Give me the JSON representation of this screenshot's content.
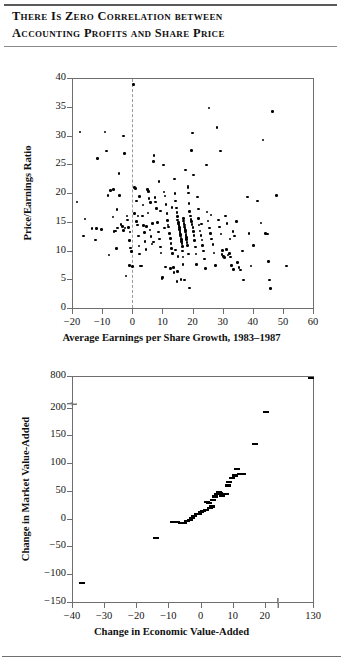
{
  "figure": {
    "title_line1": "There Is Zero Correlation between",
    "title_line2": "Accounting Profits and Share Price",
    "marker_color": "#000000",
    "axis_color": "#6e6e6e",
    "rule_color": "#5a5a5a"
  },
  "chart_data": [
    {
      "id": "scatter-pe-vs-eps-growth",
      "type": "scatter",
      "title": "",
      "xlabel": "Average Earnings per Share Growth, 1983–1987",
      "ylabel": "Price/Earnings Ratio",
      "xlim": [
        -20,
        60
      ],
      "ylim": [
        0,
        40
      ],
      "xticks": [
        -20,
        -10,
        0,
        10,
        20,
        30,
        40,
        50,
        60
      ],
      "xticklabels": [
        "−20",
        "−10",
        "0",
        "10",
        "20",
        "30",
        "40",
        "50",
        "60"
      ],
      "yticks": [
        0,
        5,
        10,
        15,
        20,
        25,
        30,
        35,
        40
      ],
      "yticklabels": [
        "0",
        "5",
        "10",
        "15",
        "20",
        "25",
        "30",
        "35",
        "40"
      ],
      "grid": false,
      "legend": "none",
      "annotations": [
        {
          "kind": "vline",
          "x": 0,
          "style": "dashed",
          "color": "#9a9a9a"
        }
      ],
      "points": [
        [
          -17.4,
          30.6
        ],
        [
          -18.3,
          18.4
        ],
        [
          -15.7,
          15.5
        ],
        [
          -16.2,
          12.5
        ],
        [
          -13.4,
          13.8
        ],
        [
          -11.9,
          13.8
        ],
        [
          -11.5,
          26.0
        ],
        [
          -12.2,
          11.8
        ],
        [
          -9.0,
          30.6
        ],
        [
          -8.5,
          27.3
        ],
        [
          -7.3,
          20.4
        ],
        [
          -6.3,
          20.6
        ],
        [
          -7.7,
          9.2
        ],
        [
          -6.4,
          15.8
        ],
        [
          -6.0,
          13.3
        ],
        [
          -5.6,
          13.4
        ],
        [
          -5.2,
          10.3
        ],
        [
          -4.9,
          13.9
        ],
        [
          -4.4,
          23.4
        ],
        [
          -4.2,
          19.6
        ],
        [
          -3.0,
          29.9
        ],
        [
          -2.6,
          26.9
        ],
        [
          -3.3,
          14.2
        ],
        [
          -2.9,
          13.5
        ],
        [
          -2.4,
          13.9
        ],
        [
          -2.1,
          5.6
        ],
        [
          -1.6,
          15.3
        ],
        [
          -1.3,
          14.0
        ],
        [
          -1.0,
          11.7
        ],
        [
          -0.7,
          13.2
        ],
        [
          -0.5,
          10.4
        ],
        [
          -0.2,
          9.8
        ],
        [
          0.4,
          38.9
        ],
        [
          0.7,
          21.0
        ],
        [
          1.1,
          20.8
        ],
        [
          1.4,
          15.0
        ],
        [
          1.8,
          14.4
        ],
        [
          2.0,
          12.5
        ],
        [
          2.3,
          10.8
        ],
        [
          2.5,
          9.4
        ],
        [
          2.8,
          7.3
        ],
        [
          3.1,
          7.3
        ],
        [
          3.4,
          16.0
        ],
        [
          3.7,
          14.3
        ],
        [
          4.0,
          13.1
        ],
        [
          4.3,
          11.6
        ],
        [
          4.6,
          10.2
        ],
        [
          5.0,
          20.6
        ],
        [
          5.3,
          20.3
        ],
        [
          5.6,
          19.0
        ],
        [
          5.9,
          13.6
        ],
        [
          6.2,
          12.4
        ],
        [
          6.5,
          11.1
        ],
        [
          6.8,
          14.7
        ],
        [
          7.1,
          25.5
        ],
        [
          7.2,
          26.5
        ],
        [
          7.5,
          19.2
        ],
        [
          7.8,
          18.4
        ],
        [
          8.1,
          17.3
        ],
        [
          8.4,
          14.9
        ],
        [
          8.7,
          13.2
        ],
        [
          9.0,
          12.0
        ],
        [
          9.3,
          10.6
        ],
        [
          9.6,
          9.6
        ],
        [
          9.9,
          5.1
        ],
        [
          10.1,
          5.3
        ],
        [
          10.4,
          24.9
        ],
        [
          10.6,
          20.2
        ],
        [
          10.9,
          19.5
        ],
        [
          11.2,
          18.0
        ],
        [
          11.5,
          16.4
        ],
        [
          11.8,
          15.2
        ],
        [
          12.0,
          14.1
        ],
        [
          12.3,
          13.0
        ],
        [
          12.6,
          12.1
        ],
        [
          12.9,
          11.2
        ],
        [
          13.1,
          10.3
        ],
        [
          13.4,
          9.5
        ],
        [
          13.6,
          7.0
        ],
        [
          13.9,
          6.2
        ],
        [
          14.0,
          22.4
        ],
        [
          14.2,
          19.9
        ],
        [
          14.4,
          18.6
        ],
        [
          14.6,
          17.4
        ],
        [
          14.8,
          16.6
        ],
        [
          15.0,
          15.9
        ],
        [
          15.1,
          15.3
        ],
        [
          15.3,
          14.9
        ],
        [
          15.4,
          14.6
        ],
        [
          15.5,
          14.3
        ],
        [
          15.6,
          14.0
        ],
        [
          15.7,
          13.7
        ],
        [
          15.8,
          13.4
        ],
        [
          15.9,
          13.1
        ],
        [
          16.0,
          12.8
        ],
        [
          16.1,
          12.5
        ],
        [
          16.2,
          12.2
        ],
        [
          16.3,
          11.9
        ],
        [
          16.4,
          11.6
        ],
        [
          16.5,
          11.2
        ],
        [
          16.6,
          10.7
        ],
        [
          16.7,
          9.9
        ],
        [
          16.8,
          8.9
        ],
        [
          16.9,
          7.6
        ],
        [
          17.0,
          15.6
        ],
        [
          17.1,
          15.1
        ],
        [
          17.2,
          14.7
        ],
        [
          17.3,
          14.4
        ],
        [
          17.4,
          14.1
        ],
        [
          17.5,
          13.8
        ],
        [
          17.6,
          13.5
        ],
        [
          17.7,
          13.2
        ],
        [
          17.8,
          12.9
        ],
        [
          17.9,
          12.6
        ],
        [
          18.0,
          12.3
        ],
        [
          18.1,
          11.9
        ],
        [
          18.2,
          11.4
        ],
        [
          18.3,
          10.9
        ],
        [
          18.5,
          21.2
        ],
        [
          18.7,
          20.0
        ],
        [
          18.9,
          18.2
        ],
        [
          19.1,
          16.8
        ],
        [
          19.3,
          16.0
        ],
        [
          19.5,
          15.4
        ],
        [
          19.7,
          15.0
        ],
        [
          19.9,
          14.5
        ],
        [
          20.1,
          14.0
        ],
        [
          20.3,
          13.3
        ],
        [
          20.5,
          12.6
        ],
        [
          20.7,
          11.7
        ],
        [
          20.9,
          10.6
        ],
        [
          21.1,
          9.4
        ],
        [
          21.3,
          7.6
        ],
        [
          20.0,
          30.4
        ],
        [
          19.6,
          27.4
        ],
        [
          20.4,
          23.1
        ],
        [
          18.5,
          21.0
        ],
        [
          17.6,
          24.0
        ],
        [
          21.6,
          19.3
        ],
        [
          21.9,
          15.6
        ],
        [
          22.2,
          14.4
        ],
        [
          22.5,
          13.4
        ],
        [
          22.8,
          12.6
        ],
        [
          23.1,
          11.8
        ],
        [
          23.4,
          10.9
        ],
        [
          23.7,
          9.9
        ],
        [
          24.0,
          8.5
        ],
        [
          24.3,
          6.9
        ],
        [
          19.0,
          3.5
        ],
        [
          17.3,
          4.9
        ],
        [
          16.2,
          5.0
        ],
        [
          15.1,
          6.3
        ],
        [
          14.8,
          4.6
        ],
        [
          24.6,
          24.9
        ],
        [
          25.5,
          34.8
        ],
        [
          24.8,
          16.7
        ],
        [
          25.2,
          15.1
        ],
        [
          25.6,
          13.9
        ],
        [
          26.0,
          13.0
        ],
        [
          26.4,
          12.0
        ],
        [
          26.8,
          11.0
        ],
        [
          27.2,
          9.6
        ],
        [
          27.6,
          7.4
        ],
        [
          28.2,
          31.4
        ],
        [
          28.6,
          15.3
        ],
        [
          29.0,
          14.1
        ],
        [
          29.4,
          12.9
        ],
        [
          29.8,
          9.3
        ],
        [
          30.2,
          9.0
        ],
        [
          30.6,
          8.8
        ],
        [
          29.2,
          27.3
        ],
        [
          31.0,
          16.0
        ],
        [
          31.4,
          14.7
        ],
        [
          31.8,
          9.2
        ],
        [
          32.2,
          9.5
        ],
        [
          32.6,
          8.9
        ],
        [
          33.0,
          7.4
        ],
        [
          33.4,
          13.3
        ],
        [
          34.0,
          12.5
        ],
        [
          34.6,
          15.0
        ],
        [
          35.0,
          7.9
        ],
        [
          35.4,
          7.0
        ],
        [
          36.0,
          6.6
        ],
        [
          36.6,
          9.9
        ],
        [
          37.0,
          4.9
        ],
        [
          38.2,
          19.3
        ],
        [
          38.8,
          13.0
        ],
        [
          39.4,
          7.3
        ],
        [
          40.2,
          10.9
        ],
        [
          41.6,
          18.6
        ],
        [
          42.8,
          14.8
        ],
        [
          43.4,
          29.2
        ],
        [
          44.3,
          13.0
        ],
        [
          44.9,
          12.9
        ],
        [
          45.3,
          8.1
        ],
        [
          45.6,
          4.9
        ],
        [
          45.9,
          3.4
        ],
        [
          46.6,
          34.2
        ],
        [
          47.9,
          19.6
        ],
        [
          51.2,
          7.3
        ],
        [
          -0.9,
          7.4
        ],
        [
          0.1,
          7.2
        ],
        [
          1.5,
          18.6
        ],
        [
          2.4,
          19.4
        ],
        [
          4.8,
          14.2
        ],
        [
          6.0,
          18.3
        ],
        [
          8.9,
          22.0
        ],
        [
          10.8,
          13.9
        ],
        [
          11.9,
          14.4
        ],
        [
          13.2,
          17.5
        ],
        [
          14.4,
          10.1
        ],
        [
          15.2,
          9.0
        ],
        [
          18.6,
          9.4
        ],
        [
          22.0,
          17.2
        ],
        [
          23.0,
          14.6
        ],
        [
          26.2,
          16.2
        ],
        [
          30.0,
          10.0
        ],
        [
          31.2,
          10.2
        ],
        [
          32.4,
          12.0
        ],
        [
          33.6,
          6.7
        ],
        [
          12.6,
          6.9
        ],
        [
          11.1,
          7.1
        ],
        [
          9.4,
          16.9
        ],
        [
          7.0,
          11.5
        ],
        [
          5.2,
          16.5
        ],
        [
          3.6,
          17.9
        ],
        [
          1.9,
          16.0
        ],
        [
          0.8,
          16.4
        ],
        [
          -1.8,
          16.0
        ],
        [
          -3.8,
          14.5
        ],
        [
          -5.0,
          17.1
        ],
        [
          -8.0,
          19.6
        ],
        [
          -10.2,
          13.7
        ]
      ]
    },
    {
      "id": "scatter-mva-vs-eva",
      "type": "scatter",
      "title": "",
      "xlabel": "Change in Economic Value-Added",
      "ylabel": "Change in Market Value-Added",
      "xlim": [
        -40,
        130
      ],
      "ylim": [
        -150,
        800
      ],
      "xticks": [
        -40,
        -30,
        -20,
        -10,
        0,
        10,
        20,
        130
      ],
      "xticklabels": [
        "−40",
        "−30",
        "−20",
        "−10",
        "0",
        "10",
        "20",
        "130"
      ],
      "yticks": [
        -150,
        -100,
        -50,
        0,
        50,
        100,
        150,
        200,
        800
      ],
      "yticklabels": [
        "−150",
        "−100",
        "−50",
        "0",
        "50",
        "100",
        "150",
        "200",
        "800"
      ],
      "grid": false,
      "legend": "none",
      "axis_breaks": {
        "x": "between 20 and 130",
        "y": "between 200 and 800"
      },
      "points": [
        [
          -37.0,
          -115
        ],
        [
          -14.0,
          -34
        ],
        [
          -8.5,
          -6
        ],
        [
          -7.4,
          -6
        ],
        [
          -6.2,
          -8
        ],
        [
          -5.2,
          -7
        ],
        [
          -4.3,
          -4
        ],
        [
          -3.4,
          -2
        ],
        [
          -2.6,
          2
        ],
        [
          -1.9,
          5
        ],
        [
          -1.2,
          8
        ],
        [
          -0.5,
          9
        ],
        [
          0.2,
          12
        ],
        [
          0.9,
          14
        ],
        [
          1.6,
          16
        ],
        [
          2.1,
          30
        ],
        [
          2.6,
          28
        ],
        [
          3.0,
          20
        ],
        [
          3.5,
          22
        ],
        [
          4.0,
          34
        ],
        [
          4.6,
          40
        ],
        [
          5.1,
          44
        ],
        [
          5.6,
          48
        ],
        [
          6.1,
          46
        ],
        [
          6.6,
          42
        ],
        [
          7.2,
          44
        ],
        [
          7.8,
          45
        ],
        [
          8.4,
          60
        ],
        [
          9.0,
          66
        ],
        [
          9.8,
          74
        ],
        [
          10.6,
          78
        ],
        [
          11.3,
          90
        ],
        [
          12.4,
          80
        ],
        [
          13.1,
          80
        ],
        [
          17.0,
          134
        ],
        [
          22.2,
          192
        ],
        [
          125.0,
          762
        ]
      ]
    }
  ]
}
